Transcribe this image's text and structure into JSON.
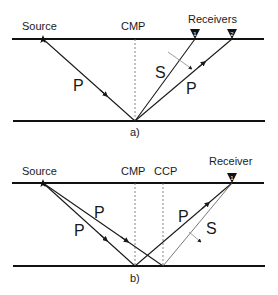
{
  "panels": [
    {
      "id": "a",
      "caption": "a)",
      "labels": {
        "source": "Source",
        "midpoint": "CMP",
        "receivers": "Receivers"
      },
      "receiver_ids": [
        "1",
        "2"
      ],
      "ray_labels": {
        "incident": "P",
        "converted": "S",
        "reflected": "P"
      }
    },
    {
      "id": "b",
      "caption": "b)",
      "labels": {
        "source": "Source",
        "midpoint": "CMP",
        "conversion_point": "CCP",
        "receiver": "Receiver"
      },
      "receiver_ids": [
        "1"
      ],
      "ray_labels": {
        "incident_upper": "P",
        "incident_lower": "P",
        "reflected": "P",
        "converted": "S"
      }
    }
  ],
  "colors": {
    "line": "#111111",
    "text": "#1a1a1a",
    "guide": "#666666"
  }
}
